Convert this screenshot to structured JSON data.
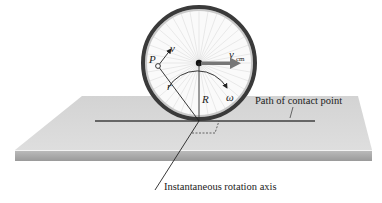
{
  "figure": {
    "colors": {
      "background": "#ffffff",
      "plane_top": "#d9d9d9",
      "plane_edge": "#a8a8a8",
      "tire": "#3a3a3a",
      "spokes": "#d8d8d8",
      "vcm_arrow": "#7a7a7a",
      "line": "#222222"
    }
  },
  "labels": {
    "point_p": "P",
    "velocity_v": "v",
    "velocity_cm": "v",
    "velocity_cm_sub": "cm",
    "radius_r": "r",
    "radius_R": "R",
    "omega": "ω",
    "path_label": "Path of contact point",
    "axis_label": "Instantaneous rotation axis"
  }
}
